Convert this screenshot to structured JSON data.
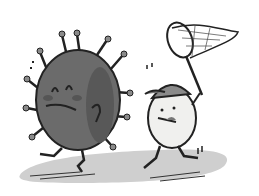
{
  "illustration": {
    "description": "Cartoon of a grumpy gray virus running away from a white round character in a baseball cap chasing it with a butterfly net",
    "colors": {
      "background": "#ffffff",
      "virus_body": "#6b6b6b",
      "virus_shadow": "#555555",
      "outline": "#222222",
      "chaser_body": "#f0f0ee",
      "cap": "#8a8a8a",
      "ground": "#c9c9c9"
    },
    "characters": [
      {
        "name": "virus",
        "expression": "frowning"
      },
      {
        "name": "chaser",
        "accessory": "baseball cap",
        "holding": "butterfly net"
      }
    ]
  }
}
